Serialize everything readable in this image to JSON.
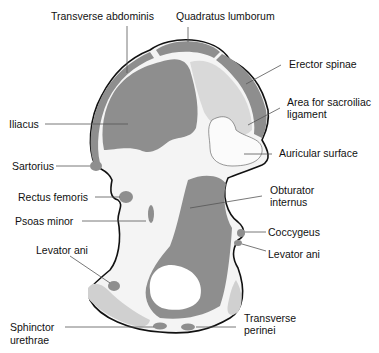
{
  "diagram": {
    "colors": {
      "muscle": "#8e8e8e",
      "bone": "#f4f4f4",
      "ligament_area": "#d9d9d9",
      "outline": "#111111",
      "background": "#ffffff"
    },
    "labels": {
      "transverse_abdominis": "Transverse abdominis",
      "quadratus_lumborum": "Quadratus lumborum",
      "erector_spinae": "Erector  spinae",
      "sacroiliac_line1": "Area for sacroiliac",
      "sacroiliac_line2": "ligament",
      "iliacus": "Iliacus",
      "auricular_surface": "Auricular surface",
      "sartorius": "Sartorius",
      "rectus_femoris": "Rectus femoris",
      "obturator_line1": "Obturator",
      "obturator_line2": "internus",
      "psoas_minor": "Psoas minor",
      "coccygeus": "Coccygeus",
      "levator_ani_left": "Levator ani",
      "levator_ani_right": "Levator ani",
      "sphincter_line1": "Sphinctor",
      "sphincter_line2": "urethrae",
      "transverse_perinei_line1": "Transverse",
      "transverse_perinei_line2": "perinei"
    }
  }
}
